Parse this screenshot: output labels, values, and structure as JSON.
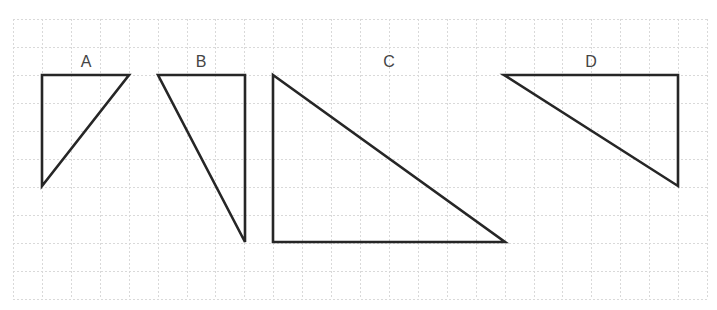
{
  "diagram": {
    "title": "",
    "grid": {
      "x_start": 13,
      "x_end": 707,
      "y_start": 19,
      "y_end": 299,
      "x_step": 28.92,
      "y_step": 28,
      "color": "#d9d9d9",
      "style": "dashed"
    },
    "stroke_color": "#262626",
    "label_color": "#444444",
    "triangles": [
      {
        "label": "A",
        "label_pos": [
          86,
          67
        ],
        "points": [
          [
            42,
            75
          ],
          [
            129,
            75
          ],
          [
            42,
            186
          ]
        ],
        "grid_units": {
          "width": 3,
          "height": 4
        }
      },
      {
        "label": "B",
        "label_pos": [
          201,
          67
        ],
        "points": [
          [
            158,
            75
          ],
          [
            245,
            75
          ],
          [
            245,
            242
          ]
        ],
        "grid_units": {
          "width": 3,
          "height": 6
        }
      },
      {
        "label": "C",
        "label_pos": [
          389,
          67
        ],
        "points": [
          [
            273,
            75
          ],
          [
            273,
            242
          ],
          [
            505,
            242
          ]
        ],
        "grid_units": {
          "width": 8,
          "height": 6
        }
      },
      {
        "label": "D",
        "label_pos": [
          591,
          67
        ],
        "points": [
          [
            504,
            75
          ],
          [
            678,
            75
          ],
          [
            678,
            186
          ]
        ],
        "grid_units": {
          "width": 6,
          "height": 4
        }
      }
    ]
  }
}
